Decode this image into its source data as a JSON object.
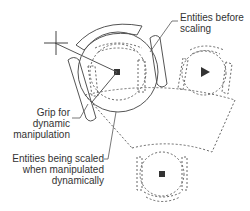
{
  "diagram": {
    "type": "CAD dynamic scaling illustration",
    "colors": {
      "background": "#ffffff",
      "line": "#555555",
      "dashed": "#666666",
      "text": "#333333",
      "grip": "#333333"
    },
    "callouts": {
      "before_scaling": {
        "line1": "Entities before",
        "line2": "scaling"
      },
      "grip": {
        "line1": "Grip for",
        "line2": "dynamic",
        "line3": "manipulation"
      },
      "being_scaled": {
        "line1": "Entities being scaled",
        "line2": "when manipulated",
        "line3": "dynamically"
      }
    },
    "elements": [
      {
        "name": "crosshair-cursor",
        "description": "crosshair at upper left"
      },
      {
        "name": "rubberband-line",
        "description": "line from crosshair to grip"
      },
      {
        "name": "scaled-entities",
        "description": "solid enlarged arcs and slots"
      },
      {
        "name": "original-entities",
        "description": "dashed circle/arc/slot group at center"
      },
      {
        "name": "right-copy",
        "description": "dashed circle group with triangle grip on right"
      },
      {
        "name": "bottom-copy",
        "description": "dashed circle group with square grip at bottom"
      },
      {
        "name": "dashed-arc-band",
        "description": "large dashed arc sector connecting groups"
      }
    ]
  }
}
